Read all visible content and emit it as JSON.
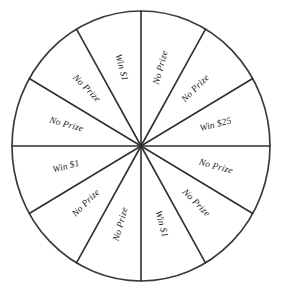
{
  "figure": {
    "name": "prize-wheel",
    "shape": "circle",
    "sector_count": 12,
    "sector_angle_degrees": 30,
    "center": {
      "x": 141,
      "y": 146
    },
    "radius_x": 129,
    "radius_y": 135,
    "colors": {
      "background": "#ffffff",
      "line": "#2f2f2f",
      "rim": "#3a3a3a",
      "text": "#1c1c1c"
    }
  },
  "chart_data": {
    "type": "pie",
    "title": "",
    "xlabel": "",
    "ylabel": "",
    "legend": "none",
    "grid": false,
    "equal_sectors": true,
    "categories": [
      "No Prize",
      "No Prize",
      "Win $25",
      "No Prize",
      "No Prize",
      "Win $1",
      "No Prize",
      "No Prize",
      "Win $1",
      "No Prize",
      "No Prize",
      "Win $1"
    ],
    "values": [
      30,
      30,
      30,
      30,
      30,
      30,
      30,
      30,
      30,
      30,
      30,
      30
    ],
    "summary": {
      "No Prize": 9,
      "Win $1": 3,
      "Win $25": 1,
      "total_sectors": 12
    }
  },
  "sectors": [
    {
      "index": 0,
      "label": "No Prize",
      "start_deg": -90,
      "end_deg": -60,
      "mid_deg": -75
    },
    {
      "index": 1,
      "label": "No Prize",
      "start_deg": -60,
      "end_deg": -30,
      "mid_deg": -45
    },
    {
      "index": 2,
      "label": "Win $25",
      "start_deg": -30,
      "end_deg": 0,
      "mid_deg": -15
    },
    {
      "index": 3,
      "label": "No Prize",
      "start_deg": 0,
      "end_deg": 30,
      "mid_deg": 15
    },
    {
      "index": 4,
      "label": "No Prize",
      "start_deg": 30,
      "end_deg": 60,
      "mid_deg": 45
    },
    {
      "index": 5,
      "label": "Win $1",
      "start_deg": 60,
      "end_deg": 90,
      "mid_deg": 75
    },
    {
      "index": 6,
      "label": "No Prize",
      "start_deg": 90,
      "end_deg": 120,
      "mid_deg": 105
    },
    {
      "index": 7,
      "label": "No Prize",
      "start_deg": 120,
      "end_deg": 150,
      "mid_deg": 135
    },
    {
      "index": 8,
      "label": "Win $1",
      "start_deg": 150,
      "end_deg": 180,
      "mid_deg": 165
    },
    {
      "index": 9,
      "label": "No Prize",
      "start_deg": 180,
      "end_deg": 210,
      "mid_deg": 195
    },
    {
      "index": 10,
      "label": "No Prize",
      "start_deg": 210,
      "end_deg": 240,
      "mid_deg": 225
    },
    {
      "index": 11,
      "label": "Win $1",
      "start_deg": 240,
      "end_deg": 270,
      "mid_deg": 255
    }
  ]
}
